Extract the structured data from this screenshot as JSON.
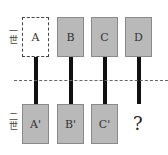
{
  "diagram": {
    "generations": [
      {
        "label": "一世"
      },
      {
        "label": "二世"
      }
    ],
    "top_row": [
      {
        "label": "A",
        "style": "dashed"
      },
      {
        "label": "B",
        "style": "filled"
      },
      {
        "label": "C",
        "style": "filled"
      },
      {
        "label": "D",
        "style": "filled"
      }
    ],
    "bottom_row": [
      {
        "label": "A'"
      },
      {
        "label": "B'"
      },
      {
        "label": "C'"
      },
      {
        "label": "?"
      }
    ],
    "colors": {
      "box_fill": "#b9b9b9",
      "bar": "#111111",
      "divider": "#666666"
    }
  }
}
